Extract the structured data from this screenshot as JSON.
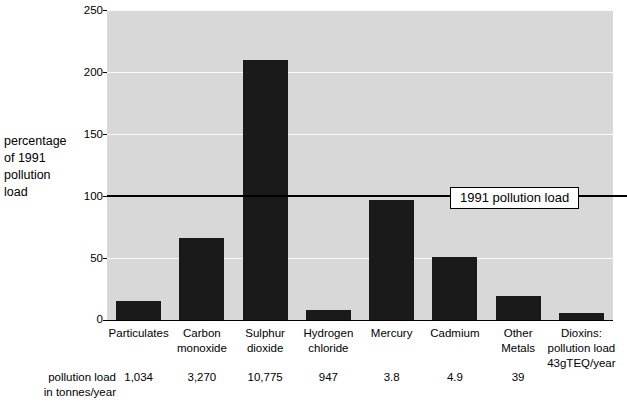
{
  "chart_data": {
    "type": "bar",
    "title": "",
    "xlabel": "",
    "ylabel": "percentage\nof 1991\npollution\nload",
    "ylim": [
      0,
      250
    ],
    "yticks": [
      0,
      50,
      100,
      150,
      200,
      250
    ],
    "grid": true,
    "legend": "none",
    "categories": [
      "Particulates",
      "Carbon\nmonoxide",
      "Sulphur\ndioxide",
      "Hydrogen\nchloride",
      "Mercury",
      "Cadmium",
      "Other\nMetals",
      "Dioxins:\npollution load\n43gTEQ/year"
    ],
    "values": [
      15,
      66,
      210,
      8,
      97,
      51,
      19,
      6
    ],
    "reference_line": {
      "value": 100,
      "label": "1991 pollution load"
    },
    "secondary_row": {
      "caption": "pollution load\nin tonnes/year",
      "values": [
        "1,034",
        "3,270",
        "10,775",
        "947",
        "3.8",
        "4.9",
        "39",
        ""
      ]
    },
    "colors": {
      "bar": "#1a1a1a",
      "plot_background": "#d8d8d8",
      "gridline": "#fbfbfb",
      "reference_line": "#000000",
      "page_background": "#ffffff",
      "text": "#000000"
    }
  }
}
